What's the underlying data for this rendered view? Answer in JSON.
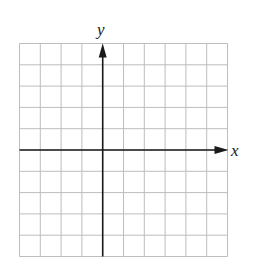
{
  "chart_data": {
    "type": "coordinate-grid",
    "title": "",
    "xlabel": "x",
    "ylabel": "y",
    "grid": true,
    "grid_cells": {
      "columns": 10,
      "rows": 10
    },
    "x_axis_position": {
      "from_top_line": 5
    },
    "y_axis_position": {
      "from_left_line": 4
    },
    "xlim": [
      -4,
      6
    ],
    "ylim": [
      -5,
      5
    ],
    "ticks_labeled": false,
    "data_points": [],
    "colors": {
      "grid": "#bdbdbd",
      "axis": "#1a1a1a",
      "background": "#ffffff"
    }
  },
  "labels": {
    "x_axis": "x",
    "y_axis": "y"
  }
}
